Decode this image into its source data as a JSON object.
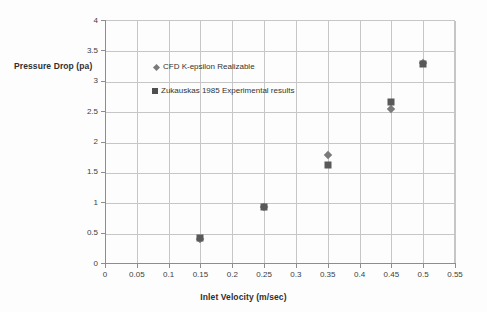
{
  "chart_data": {
    "type": "scatter",
    "title": "",
    "xlabel": "Inlet Velocity  (m/sec)",
    "ylabel": "Pressure Drop (pa)",
    "xlim": [
      0,
      0.55
    ],
    "ylim": [
      0,
      4
    ],
    "grid": true,
    "legend_position": "inside-upper-left",
    "xticks": [
      "0",
      "0.05",
      "0.1",
      "0.15",
      "0.2",
      "0.25",
      "0.3",
      "0.35",
      "0.4",
      "0.45",
      "0.5",
      "0.55"
    ],
    "xtick_values": [
      0,
      0.05,
      0.1,
      0.15,
      0.2,
      0.25,
      0.3,
      0.35,
      0.4,
      0.45,
      0.5,
      0.55
    ],
    "yticks": [
      "0",
      "0.5",
      "1",
      "1.5",
      "2",
      "2.5",
      "3",
      "3.5",
      "4"
    ],
    "ytick_values": [
      0,
      0.5,
      1,
      1.5,
      2,
      2.5,
      3,
      3.5,
      4
    ],
    "series": [
      {
        "name": "CFD  K-epsilon Realizable",
        "marker": "diamond",
        "color": "#7a7a7a",
        "x": [
          0.15,
          0.25,
          0.35,
          0.45,
          0.5
        ],
        "values": [
          0.39,
          0.92,
          1.77,
          2.54,
          3.3
        ]
      },
      {
        "name": "Zukauskas 1985 Experimental results",
        "marker": "square",
        "color": "#595959",
        "x": [
          0.15,
          0.25,
          0.35,
          0.45,
          0.5
        ],
        "values": [
          0.41,
          0.93,
          1.61,
          2.65,
          3.27
        ]
      }
    ]
  },
  "axes": {
    "x_title": "Inlet Velocity  (m/sec)",
    "y_title": "Pressure Drop (pa)"
  },
  "legend": {
    "items": [
      {
        "label": "CFD  K-epsilon Realizable",
        "marker": "diamond"
      },
      {
        "label": "Zukauskas 1985 Experimental results",
        "marker": "square"
      }
    ]
  },
  "colors": {
    "grid": "#c6c6c6",
    "axis": "#8d8d8d",
    "series_cfd": "#7a7a7a",
    "series_zukauskas": "#595959",
    "background": "#fdfdfd",
    "text": "#333333"
  }
}
